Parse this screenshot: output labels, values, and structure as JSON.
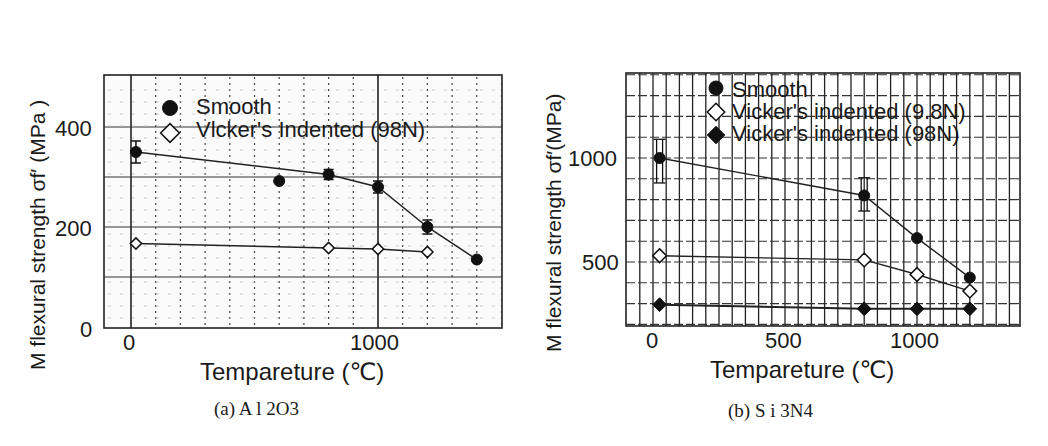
{
  "figure": {
    "panels": [
      {
        "id": "a",
        "caption": "(a) Al₂O₃",
        "caption_text": "(a) A l 2O3",
        "ylabel": "M flexural strength  σf′ (MPa )",
        "xlabel": "Tempareture    (℃)",
        "xticks": [
          {
            "label": "0",
            "value": 0
          },
          {
            "label": "1000",
            "value": 1000
          }
        ],
        "yticks": [
          {
            "label": "0",
            "value": 0
          },
          {
            "label": "200",
            "value": 200
          },
          {
            "label": "400",
            "value": 400
          }
        ],
        "legend": [
          {
            "label": "Smooth",
            "marker": "filled-circle"
          },
          {
            "label": "Vlcker's Indented (98N)",
            "marker": "open-diamond"
          }
        ]
      },
      {
        "id": "b",
        "caption": "(b) Si₃N₄",
        "caption_text": "(b) S i 3N4",
        "ylabel": "M flexural strength  σf′(MPa)",
        "xlabel": "Tempareture (℃)",
        "xticks": [
          {
            "label": "0",
            "value": 0
          },
          {
            "label": "500",
            "value": 500
          },
          {
            "label": "1000",
            "value": 1000
          }
        ],
        "yticks": [
          {
            "label": "500",
            "value": 500
          },
          {
            "label": "1000",
            "value": 1000
          }
        ],
        "legend": [
          {
            "label": "Smooth",
            "marker": "filled-circle"
          },
          {
            "label": "Vicker's indented (9.8N)",
            "marker": "open-diamond"
          },
          {
            "label": "Vicker's indented (98N)",
            "marker": "filled-diamond"
          }
        ]
      }
    ]
  },
  "chart_data": [
    {
      "type": "line",
      "title": "(a) Al2O3",
      "xlabel": "Tempareture (℃)",
      "ylabel": "M flexural strength σf' (MPa)",
      "xlim": [
        -100,
        1510
      ],
      "ylim": [
        0,
        505
      ],
      "xticks": [
        0,
        1000
      ],
      "yticks": [
        0,
        200,
        400
      ],
      "grid": true,
      "legend_position": "upper-left inside",
      "series": [
        {
          "name": "Smooth",
          "marker": "filled-circle",
          "x": [
            20,
            600,
            800,
            1000,
            1200,
            1400
          ],
          "y": [
            350,
            292,
            305,
            280,
            200,
            135
          ],
          "error_bars_at_x": [
            20,
            800,
            1000,
            1200
          ]
        },
        {
          "name": "Vlcker's Indented (98N)",
          "marker": "open-diamond",
          "x": [
            20,
            800,
            1000,
            1200
          ],
          "y": [
            167,
            158,
            156,
            150
          ]
        }
      ]
    },
    {
      "type": "line",
      "title": "(b) Si3N4",
      "xlabel": "Tempareture (℃)",
      "ylabel": "M flexural strength σf' (MPa)",
      "xlim": [
        -100,
        1390
      ],
      "ylim": [
        190,
        1410
      ],
      "xticks": [
        0,
        500,
        1000
      ],
      "yticks": [
        500,
        1000
      ],
      "grid": true,
      "legend_position": "upper-left inside",
      "series": [
        {
          "name": "Smooth",
          "marker": "filled-circle",
          "x": [
            25,
            800,
            1000,
            1200
          ],
          "y": [
            1000,
            820,
            615,
            425
          ],
          "error_bars_at_x": [
            25,
            800
          ]
        },
        {
          "name": "Vicker's indented (9.8N)",
          "marker": "open-diamond",
          "x": [
            25,
            800,
            1000,
            1200
          ],
          "y": [
            530,
            510,
            440,
            360
          ]
        },
        {
          "name": "Vicker's indented (98N)",
          "marker": "filled-diamond",
          "x": [
            25,
            800,
            1000,
            1200
          ],
          "y": [
            295,
            275,
            275,
            275
          ]
        }
      ]
    }
  ]
}
